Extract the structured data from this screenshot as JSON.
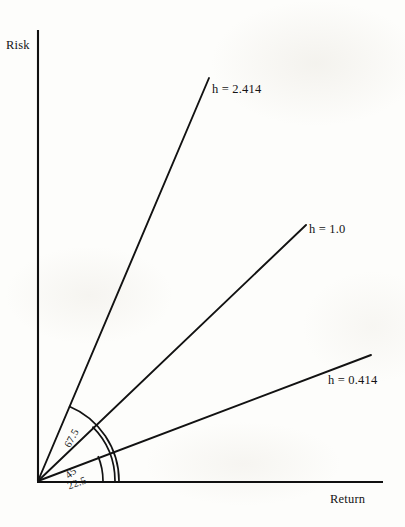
{
  "figure": {
    "background_color": "#fdfdfb",
    "ink_color": "#141414",
    "width": 405,
    "height": 527
  },
  "axes": {
    "y_label": "Risk",
    "x_label": "Return",
    "origin": {
      "x": 38,
      "y": 481
    },
    "y_top": {
      "x": 38,
      "y": 30
    },
    "x_right": {
      "x": 383,
      "y": 482
    }
  },
  "chart_data": {
    "type": "line",
    "title": "",
    "xlabel": "Return",
    "ylabel": "Risk",
    "grid": false,
    "legend": "none",
    "series": [
      {
        "name": "h = 2.414",
        "label": "h = 2.414",
        "h_value": 2.414,
        "angle_deg": 67.5,
        "angle_label": "67.5",
        "slope": 2.414,
        "ray_end": {
          "x": 209,
          "y": 78
        },
        "label_pos": {
          "x": 212,
          "y": 82
        },
        "arc_radius": 81,
        "angle_label_pos": {
          "x": 62,
          "y": 444
        },
        "angle_label_rotation": -62
      },
      {
        "name": "h = 1.0",
        "label": "h = 1.0",
        "h_value": 1.0,
        "angle_deg": 45,
        "angle_label": "45",
        "slope": 1.0,
        "ray_end": {
          "x": 306,
          "y": 225
        },
        "label_pos": {
          "x": 309,
          "y": 222
        },
        "arc_radius": 77,
        "angle_label_pos": {
          "x": 63,
          "y": 472
        },
        "angle_label_rotation": -40
      },
      {
        "name": "h = 0.414",
        "label": "h = 0.414",
        "h_value": 0.414,
        "angle_deg": 22.5,
        "angle_label": "22.5",
        "slope": 0.414,
        "ray_end": {
          "x": 371,
          "y": 355
        },
        "label_pos": {
          "x": 328,
          "y": 373
        },
        "arc_radius": 65,
        "angle_label_pos": {
          "x": 66,
          "y": 481
        },
        "angle_label_rotation": -20
      }
    ],
    "x": [
      0,
      1
    ],
    "xlim": [
      0,
      1
    ],
    "ylim": [
      0,
      1
    ]
  }
}
